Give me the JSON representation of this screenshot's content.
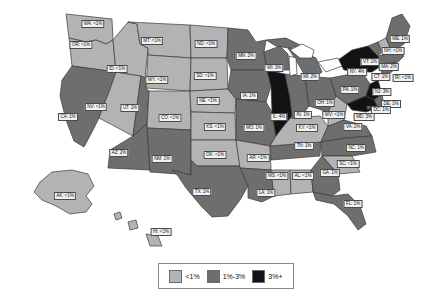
{
  "chart_data": {
    "type": "heatmap",
    "title": "",
    "subtitle": "",
    "xlabel": "",
    "ylabel": "",
    "map_kind": "us-choropleth",
    "value_unit": "%",
    "legend_position": "bottom-center",
    "grid": false,
    "categories": [
      "WA",
      "OR",
      "ID",
      "MT",
      "WY",
      "ND",
      "SD",
      "NE",
      "KS",
      "OK",
      "TX",
      "NM",
      "AZ",
      "UT",
      "NV",
      "CA",
      "CO",
      "MN",
      "IA",
      "MO",
      "AR",
      "LA",
      "MS",
      "AL",
      "TN",
      "KY",
      "IL",
      "IN",
      "OH",
      "MI",
      "WI",
      "WV",
      "VA",
      "NC",
      "SC",
      "GA",
      "FL",
      "PA",
      "NY",
      "NJ",
      "CT",
      "RI",
      "MA",
      "VT",
      "NH",
      "ME",
      "MD",
      "DE",
      "DC",
      "AK",
      "HI"
    ],
    "values": [
      "<1%",
      "<1%",
      "<1%",
      "<1%",
      "<1%",
      "<1%",
      "<1%",
      "<1%",
      "<1%",
      "<1%",
      "1%",
      "1%",
      "2%",
      "1%",
      "<1%",
      "1%",
      "<1%",
      "2%",
      "1%",
      "1%",
      "<1%",
      "1%",
      "<1%",
      "<1%",
      "1%",
      "<1%",
      "4%",
      "1%",
      "1%",
      "2%",
      "1%",
      "<1%",
      "2%",
      "1%",
      "<1%",
      "1%",
      "1%",
      "1%",
      "4%",
      "3%",
      "1%",
      "<1%",
      "2%",
      "1%",
      "<1%",
      "1%",
      "3%",
      "1%",
      "1%",
      "<1%",
      "<1%"
    ],
    "tiers": [
      "low",
      "low",
      "low",
      "low",
      "low",
      "low",
      "low",
      "low",
      "low",
      "low",
      "mid",
      "mid",
      "mid",
      "mid",
      "low",
      "mid",
      "low",
      "mid",
      "mid",
      "mid",
      "low",
      "mid",
      "low",
      "low",
      "mid",
      "low",
      "high",
      "mid",
      "mid",
      "mid",
      "mid",
      "low",
      "mid",
      "mid",
      "low",
      "mid",
      "mid",
      "mid",
      "high",
      "high",
      "mid",
      "low",
      "mid",
      "mid",
      "low",
      "mid",
      "high",
      "mid",
      "mid",
      "low",
      "low"
    ],
    "legend": {
      "entries": [
        {
          "label": "<1%",
          "color": "#b3b3b3",
          "tier": "low"
        },
        {
          "label": "1%-3%",
          "color": "#6e6e6e",
          "tier": "mid"
        },
        {
          "label": "3%+",
          "color": "#121212",
          "tier": "high"
        }
      ]
    }
  },
  "map": {
    "labels": [
      {
        "id": "WA",
        "text": "WA: <1%",
        "x": 93,
        "y": 24
      },
      {
        "id": "OR",
        "text": "OR: <1%",
        "x": 81,
        "y": 45
      },
      {
        "id": "ID",
        "text": "ID: <1%",
        "x": 117,
        "y": 69
      },
      {
        "id": "MT",
        "text": "MT: <1%",
        "x": 152,
        "y": 41
      },
      {
        "id": "WY",
        "text": "WY: <1%",
        "x": 157,
        "y": 80
      },
      {
        "id": "ND",
        "text": "ND: <1%",
        "x": 206,
        "y": 44
      },
      {
        "id": "SD",
        "text": "SD: <1%",
        "x": 205,
        "y": 76
      },
      {
        "id": "NE",
        "text": "NE: <1%",
        "x": 208,
        "y": 101
      },
      {
        "id": "KS",
        "text": "KS: <1%",
        "x": 215,
        "y": 127
      },
      {
        "id": "OK",
        "text": "OK: <1%",
        "x": 215,
        "y": 155
      },
      {
        "id": "TX",
        "text": "TX: 1%",
        "x": 202,
        "y": 192
      },
      {
        "id": "NM",
        "text": "NM: 1%",
        "x": 162,
        "y": 159
      },
      {
        "id": "AZ",
        "text": "AZ: 2%",
        "x": 119,
        "y": 153
      },
      {
        "id": "UT",
        "text": "UT: 1%",
        "x": 130,
        "y": 108
      },
      {
        "id": "NV",
        "text": "NV: <1%",
        "x": 96,
        "y": 107
      },
      {
        "id": "CA",
        "text": "CA: 1%",
        "x": 68,
        "y": 117
      },
      {
        "id": "CO",
        "text": "CO: <1%",
        "x": 170,
        "y": 118
      },
      {
        "id": "MN",
        "text": "MN: 2%",
        "x": 246,
        "y": 56
      },
      {
        "id": "IA",
        "text": "IA: 1%",
        "x": 249,
        "y": 96
      },
      {
        "id": "MO",
        "text": "MO: 1%",
        "x": 254,
        "y": 128
      },
      {
        "id": "AR",
        "text": "AR: <1%",
        "x": 258,
        "y": 158
      },
      {
        "id": "LA",
        "text": "LA: 1%",
        "x": 266,
        "y": 193
      },
      {
        "id": "MS",
        "text": "MS: <1%",
        "x": 277,
        "y": 176
      },
      {
        "id": "AL",
        "text": "AL: <1%",
        "x": 303,
        "y": 176
      },
      {
        "id": "TN",
        "text": "TN: 1%",
        "x": 304,
        "y": 146
      },
      {
        "id": "KY",
        "text": "KY: <1%",
        "x": 307,
        "y": 128
      },
      {
        "id": "IL",
        "text": "IL: 4%",
        "x": 279,
        "y": 117
      },
      {
        "id": "IN",
        "text": "IN: 1%",
        "x": 303,
        "y": 115
      },
      {
        "id": "OH",
        "text": "OH: 1%",
        "x": 325,
        "y": 103
      },
      {
        "id": "MI",
        "text": "MI: 2%",
        "x": 310,
        "y": 77
      },
      {
        "id": "WI",
        "text": "WI: 1%",
        "x": 274,
        "y": 68
      },
      {
        "id": "WV",
        "text": "WV: <1%",
        "x": 334,
        "y": 115
      },
      {
        "id": "VA",
        "text": "VA: 2%",
        "x": 353,
        "y": 127
      },
      {
        "id": "NC",
        "text": "NC: 1%",
        "x": 356,
        "y": 148
      },
      {
        "id": "SC",
        "text": "SC: <1%",
        "x": 348,
        "y": 164
      },
      {
        "id": "GA",
        "text": "GA: 1%",
        "x": 330,
        "y": 173
      },
      {
        "id": "FL",
        "text": "FL: 1%",
        "x": 353,
        "y": 204
      },
      {
        "id": "PA",
        "text": "PA: 1%",
        "x": 350,
        "y": 90
      },
      {
        "id": "NY",
        "text": "NY: 4%",
        "x": 357,
        "y": 72
      },
      {
        "id": "NJ",
        "text": "NJ: 3%",
        "x": 382,
        "y": 92
      },
      {
        "id": "CT",
        "text": "CT: 1%",
        "x": 381,
        "y": 77
      },
      {
        "id": "RI",
        "text": "RI: <1%",
        "x": 403,
        "y": 78
      },
      {
        "id": "MA",
        "text": "MA: 2%",
        "x": 389,
        "y": 67
      },
      {
        "id": "VT",
        "text": "VT: 1%",
        "x": 370,
        "y": 62
      },
      {
        "id": "NH",
        "text": "NH: <1%",
        "x": 393,
        "y": 51
      },
      {
        "id": "ME",
        "text": "ME: 1%",
        "x": 400,
        "y": 39
      },
      {
        "id": "MD",
        "text": "MD: 3%",
        "x": 364,
        "y": 117
      },
      {
        "id": "DE",
        "text": "DE: 1%",
        "x": 391,
        "y": 104
      },
      {
        "id": "DC",
        "text": "DC: 1%",
        "x": 381,
        "y": 110
      },
      {
        "id": "AK",
        "text": "AK: <1%",
        "x": 65,
        "y": 196
      },
      {
        "id": "HI",
        "text": "HI: <1%",
        "x": 161,
        "y": 232
      }
    ]
  }
}
